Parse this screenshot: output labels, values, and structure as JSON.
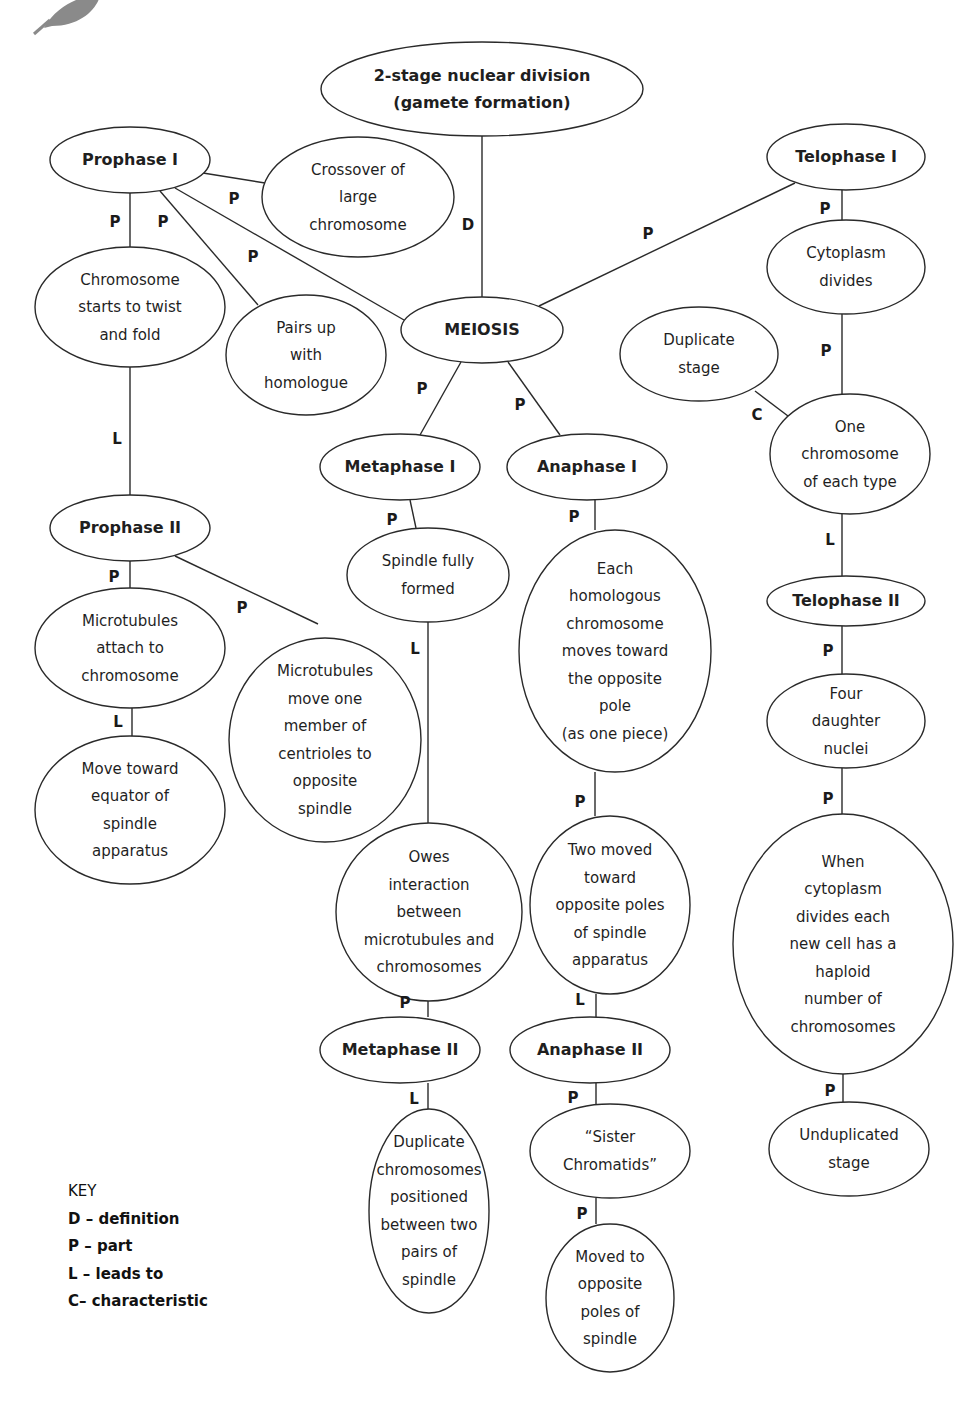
{
  "diagram": {
    "type": "concept-map",
    "title": "MEIOSIS",
    "nodes": [
      {
        "id": "def",
        "label": "2-stage nuclear division\n(gamete formation)",
        "bold": true,
        "cx": 482,
        "cy": 89,
        "rx": 161,
        "ry": 47
      },
      {
        "id": "meiosis",
        "label": "MEIOSIS",
        "bold": true,
        "cx": 482,
        "cy": 330,
        "rx": 81,
        "ry": 33
      },
      {
        "id": "prophase1",
        "label": "Prophase I",
        "bold": true,
        "cx": 130,
        "cy": 160,
        "rx": 80,
        "ry": 33
      },
      {
        "id": "crossover",
        "label": "Crossover of\nlarge\nchromosome",
        "bold": false,
        "cx": 358,
        "cy": 197,
        "rx": 96,
        "ry": 60
      },
      {
        "id": "twist",
        "label": "Chromosome\nstarts to twist\nand fold",
        "bold": false,
        "cx": 130,
        "cy": 307,
        "rx": 95,
        "ry": 60
      },
      {
        "id": "pairs",
        "label": "Pairs up\nwith\nhomologue",
        "bold": false,
        "cx": 306,
        "cy": 355,
        "rx": 80,
        "ry": 60
      },
      {
        "id": "telophase1",
        "label": "Telophase I",
        "bold": true,
        "cx": 846,
        "cy": 157,
        "rx": 79,
        "ry": 33
      },
      {
        "id": "cytoplasm",
        "label": "Cytoplasm\ndivides",
        "bold": false,
        "cx": 846,
        "cy": 267,
        "rx": 79,
        "ry": 47
      },
      {
        "id": "duplicate",
        "label": "Duplicate\nstage",
        "bold": false,
        "cx": 699,
        "cy": 354,
        "rx": 79,
        "ry": 47
      },
      {
        "id": "onechrom",
        "label": "One\nchromosome\nof each type",
        "bold": false,
        "cx": 850,
        "cy": 454,
        "rx": 80,
        "ry": 60
      },
      {
        "id": "metaphase1",
        "label": "Metaphase I",
        "bold": true,
        "cx": 400,
        "cy": 467,
        "rx": 80,
        "ry": 33
      },
      {
        "id": "anaphase1",
        "label": "Anaphase I",
        "bold": true,
        "cx": 587,
        "cy": 467,
        "rx": 80,
        "ry": 33
      },
      {
        "id": "spindle",
        "label": "Spindle fully\nformed",
        "bold": false,
        "cx": 428,
        "cy": 575,
        "rx": 81,
        "ry": 47
      },
      {
        "id": "homologous",
        "label": "Each\nhomologous\nchromosome\nmoves toward\nthe opposite\npole\n(as one piece)",
        "bold": false,
        "cx": 615,
        "cy": 651,
        "rx": 96,
        "ry": 121
      },
      {
        "id": "prophase2",
        "label": "Prophase II",
        "bold": true,
        "cx": 130,
        "cy": 528,
        "rx": 80,
        "ry": 33
      },
      {
        "id": "attach",
        "label": "Microtubules\nattach to\nchromosome",
        "bold": false,
        "cx": 130,
        "cy": 648,
        "rx": 95,
        "ry": 60
      },
      {
        "id": "centrioles",
        "label": "Microtubules\nmove one\nmember of\ncentrioles to\nopposite\nspindle",
        "bold": false,
        "cx": 325,
        "cy": 740,
        "rx": 96,
        "ry": 102
      },
      {
        "id": "equator",
        "label": "Move toward\nequator of\nspindle\napparatus",
        "bold": false,
        "cx": 130,
        "cy": 810,
        "rx": 95,
        "ry": 74
      },
      {
        "id": "telophase2",
        "label": "Telophase II",
        "bold": true,
        "cx": 846,
        "cy": 601,
        "rx": 79,
        "ry": 25
      },
      {
        "id": "four",
        "label": "Four\ndaughter\nnuclei",
        "bold": false,
        "cx": 846,
        "cy": 721,
        "rx": 79,
        "ry": 47
      },
      {
        "id": "haploid",
        "label": "When\ncytoplasm\ndivides each\nnew cell has a\nhaploid\nnumber of\nchromosomes",
        "bold": false,
        "cx": 843,
        "cy": 944,
        "rx": 110,
        "ry": 130
      },
      {
        "id": "owes",
        "label": "Owes\ninteraction\nbetween\nmicrotubules and\nchromosomes",
        "bold": false,
        "cx": 429,
        "cy": 912,
        "rx": 93,
        "ry": 89
      },
      {
        "id": "twomoved",
        "label": "Two moved\ntoward\nopposite poles\nof spindle\napparatus",
        "bold": false,
        "cx": 610,
        "cy": 905,
        "rx": 80,
        "ry": 89
      },
      {
        "id": "metaphase2",
        "label": "Metaphase II",
        "bold": true,
        "cx": 400,
        "cy": 1050,
        "rx": 80,
        "ry": 33
      },
      {
        "id": "anaphase2",
        "label": "Anaphase II",
        "bold": true,
        "cx": 590,
        "cy": 1050,
        "rx": 80,
        "ry": 33
      },
      {
        "id": "duplicatechrom",
        "label": "Duplicate\nchromosomes\npositioned\nbetween two\npairs of\nspindle",
        "bold": false,
        "cx": 429,
        "cy": 1211,
        "rx": 60,
        "ry": 102
      },
      {
        "id": "sister",
        "label": "“Sister\nChromatids”",
        "bold": false,
        "cx": 610,
        "cy": 1151,
        "rx": 80,
        "ry": 47
      },
      {
        "id": "movedto",
        "label": "Moved to\nopposite\npoles of\nspindle",
        "bold": false,
        "cx": 610,
        "cy": 1298,
        "rx": 64,
        "ry": 74
      },
      {
        "id": "unduplicated",
        "label": "Unduplicated\nstage",
        "bold": false,
        "cx": 849,
        "cy": 1149,
        "rx": 80,
        "ry": 47
      }
    ],
    "edges": [
      {
        "from": "def",
        "to": "meiosis",
        "label": "D",
        "x1": 482,
        "y1": 136,
        "x2": 482,
        "y2": 297,
        "lx": 468,
        "ly": 230
      },
      {
        "from": "prophase1",
        "to": "meiosis",
        "label": "P",
        "x1": 175,
        "y1": 188,
        "x2": 404,
        "y2": 320,
        "lx": 253,
        "ly": 262
      },
      {
        "from": "prophase1",
        "to": "crossover",
        "label": "P",
        "x1": 203,
        "y1": 173,
        "x2": 265,
        "y2": 183,
        "lx": 234,
        "ly": 204
      },
      {
        "from": "prophase1",
        "to": "twist",
        "label": "P",
        "x1": 130,
        "y1": 193,
        "x2": 130,
        "y2": 247,
        "lx": 115,
        "ly": 227
      },
      {
        "from": "prophase1",
        "to": "pairs",
        "label": "P",
        "x1": 160,
        "y1": 191,
        "x2": 258,
        "y2": 305,
        "lx": 163,
        "ly": 227
      },
      {
        "from": "meiosis",
        "to": "telophase1",
        "label": "P",
        "x1": 539,
        "y1": 306,
        "x2": 795,
        "y2": 183,
        "lx": 648,
        "ly": 239
      },
      {
        "from": "telophase1",
        "to": "cytoplasm",
        "label": "P",
        "x1": 842,
        "y1": 190,
        "x2": 842,
        "y2": 220,
        "lx": 825,
        "ly": 214
      },
      {
        "from": "cytoplasm",
        "to": "onechrom",
        "label": "P",
        "x1": 842,
        "y1": 314,
        "x2": 842,
        "y2": 394,
        "lx": 826,
        "ly": 356
      },
      {
        "from": "onechrom",
        "to": "duplicate",
        "label": "C",
        "x1": 788,
        "y1": 416,
        "x2": 755,
        "y2": 391,
        "lx": 757,
        "ly": 420
      },
      {
        "from": "onechrom",
        "to": "telophase2",
        "label": "L",
        "x1": 842,
        "y1": 514,
        "x2": 842,
        "y2": 576,
        "lx": 830,
        "ly": 545
      },
      {
        "from": "meiosis",
        "to": "metaphase1",
        "label": "P",
        "x1": 461,
        "y1": 362,
        "x2": 420,
        "y2": 435,
        "lx": 422,
        "ly": 394
      },
      {
        "from": "meiosis",
        "to": "anaphase1",
        "label": "P",
        "x1": 508,
        "y1": 362,
        "x2": 560,
        "y2": 435,
        "lx": 520,
        "ly": 410
      },
      {
        "from": "metaphase1",
        "to": "spindle",
        "label": "P",
        "x1": 410,
        "y1": 500,
        "x2": 416,
        "y2": 528,
        "lx": 392,
        "ly": 525
      },
      {
        "from": "anaphase1",
        "to": "homologous",
        "label": "P",
        "x1": 595,
        "y1": 500,
        "x2": 595,
        "y2": 530,
        "lx": 574,
        "ly": 522
      },
      {
        "from": "twist",
        "to": "prophase2",
        "label": "L",
        "x1": 130,
        "y1": 367,
        "x2": 130,
        "y2": 495,
        "lx": 117,
        "ly": 444
      },
      {
        "from": "prophase2",
        "to": "attach",
        "label": "P",
        "x1": 130,
        "y1": 561,
        "x2": 130,
        "y2": 588,
        "lx": 114,
        "ly": 582
      },
      {
        "from": "prophase2",
        "to": "centrioles",
        "label": "P",
        "x1": 175,
        "y1": 556,
        "x2": 318,
        "y2": 624,
        "lx": 242,
        "ly": 613
      },
      {
        "from": "attach",
        "to": "equator",
        "label": "L",
        "x1": 132,
        "y1": 708,
        "x2": 132,
        "y2": 736,
        "lx": 118,
        "ly": 727
      },
      {
        "from": "telophase2",
        "to": "four",
        "label": "P",
        "x1": 842,
        "y1": 626,
        "x2": 842,
        "y2": 674,
        "lx": 828,
        "ly": 656
      },
      {
        "from": "four",
        "to": "haploid",
        "label": "P",
        "x1": 842,
        "y1": 768,
        "x2": 842,
        "y2": 814,
        "lx": 828,
        "ly": 804
      },
      {
        "from": "spindle",
        "to": "owes",
        "label": "L",
        "x1": 428,
        "y1": 622,
        "x2": 428,
        "y2": 823,
        "lx": 415,
        "ly": 654
      },
      {
        "from": "homologous",
        "to": "twomoved",
        "label": "P",
        "x1": 595,
        "y1": 772,
        "x2": 595,
        "y2": 816,
        "lx": 580,
        "ly": 807
      },
      {
        "from": "owes",
        "to": "metaphase2",
        "label": "P",
        "x1": 428,
        "y1": 1001,
        "x2": 428,
        "y2": 1017,
        "lx": 405,
        "ly": 1008
      },
      {
        "from": "twomoved",
        "to": "anaphase2",
        "label": "L",
        "x1": 596,
        "y1": 994,
        "x2": 596,
        "y2": 1017,
        "lx": 580,
        "ly": 1005
      },
      {
        "from": "metaphase2",
        "to": "duplicatechrom",
        "label": "L",
        "x1": 428,
        "y1": 1083,
        "x2": 428,
        "y2": 1110,
        "lx": 414,
        "ly": 1104
      },
      {
        "from": "anaphase2",
        "to": "sister",
        "label": "P",
        "x1": 596,
        "y1": 1083,
        "x2": 596,
        "y2": 1104,
        "lx": 573,
        "ly": 1103
      },
      {
        "from": "sister",
        "to": "movedto",
        "label": "P",
        "x1": 596,
        "y1": 1198,
        "x2": 596,
        "y2": 1224,
        "lx": 582,
        "ly": 1219
      },
      {
        "from": "haploid",
        "to": "unduplicated",
        "label": "P",
        "x1": 843,
        "y1": 1074,
        "x2": 843,
        "y2": 1102,
        "lx": 830,
        "ly": 1096
      }
    ]
  },
  "key": {
    "title": "KEY",
    "items": [
      {
        "symbol": "D",
        "meaning": "D – definition"
      },
      {
        "symbol": "P",
        "meaning": "P – part"
      },
      {
        "symbol": "L",
        "meaning": "L – leads to"
      },
      {
        "symbol": "C",
        "meaning": "C– characteristic"
      }
    ]
  },
  "decorations": {
    "corner_icon": "leaf-icon",
    "line_color": "#2a2a2a",
    "node_fill": "#ffffff"
  }
}
